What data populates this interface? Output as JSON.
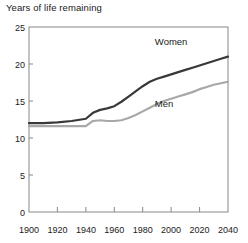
{
  "chart_data": {
    "type": "line",
    "title": "Years of life remaining",
    "xlabel": "",
    "ylabel": "",
    "xlim": [
      1900,
      2040
    ],
    "ylim": [
      0,
      25
    ],
    "grid": false,
    "legend_position": "inline-annotation",
    "x_ticks": [
      1900,
      1920,
      1940,
      1960,
      1980,
      2000,
      2020,
      2040
    ],
    "y_ticks": [
      0,
      5,
      10,
      15,
      20,
      25
    ],
    "x": [
      1900,
      1910,
      1920,
      1930,
      1940,
      1945,
      1950,
      1955,
      1960,
      1965,
      1970,
      1975,
      1980,
      1985,
      1990,
      1995,
      2000,
      2005,
      2010,
      2015,
      2020,
      2025,
      2030,
      2035,
      2040
    ],
    "series": [
      {
        "name": "Women",
        "color": "#383838",
        "values": [
          12.0,
          12.0,
          12.1,
          12.3,
          12.6,
          13.4,
          13.8,
          14.0,
          14.3,
          14.9,
          15.6,
          16.3,
          17.0,
          17.6,
          18.0,
          18.3,
          18.6,
          18.9,
          19.2,
          19.5,
          19.8,
          20.1,
          20.4,
          20.7,
          21.0
        ]
      },
      {
        "name": "Men",
        "color": "#a8a8a8",
        "values": [
          11.6,
          11.6,
          11.6,
          11.6,
          11.6,
          12.3,
          12.4,
          12.3,
          12.3,
          12.4,
          12.7,
          13.1,
          13.6,
          14.1,
          14.6,
          15.0,
          15.3,
          15.6,
          15.9,
          16.2,
          16.6,
          16.9,
          17.2,
          17.4,
          17.6
        ]
      }
    ],
    "annotations": [
      {
        "text": "Women",
        "x": 2000,
        "y": 22.6
      },
      {
        "text": "Men",
        "x": 1995,
        "y": 14.2
      }
    ]
  },
  "axis": {
    "y_tick_labels": [
      "0",
      "5",
      "10",
      "15",
      "20",
      "25"
    ],
    "x_tick_labels": [
      "1900",
      "1920",
      "1940",
      "1960",
      "1980",
      "2000",
      "2020",
      "2040"
    ]
  },
  "labels": {
    "women": "Women",
    "men": "Men"
  }
}
